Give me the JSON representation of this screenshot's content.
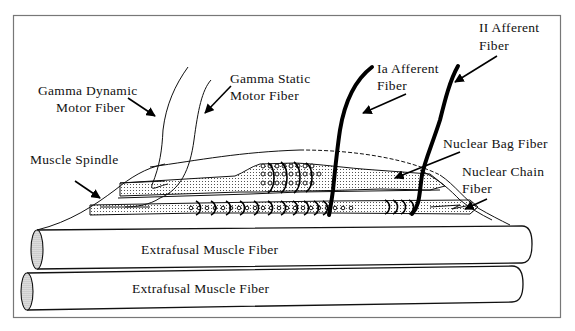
{
  "figure": {
    "labels": {
      "gamma_dynamic": [
        "Gamma Dynamic",
        "Motor Fiber"
      ],
      "gamma_static": [
        "Gamma Static",
        "Motor Fiber"
      ],
      "ia_afferent": [
        "Ia Afferent",
        "Fiber"
      ],
      "ii_afferent": [
        "II Afferent",
        "Fiber"
      ],
      "muscle_spindle": "Muscle Spindle",
      "nuclear_bag": "Nuclear Bag Fiber",
      "nuclear_chain": [
        "Nuclear Chain",
        "Fiber"
      ],
      "extrafusal_1": "Extrafusal Muscle Fiber",
      "extrafusal_2": "Extrafusal Muscle Fiber"
    },
    "colors": {
      "ink": "#111111",
      "background": "#ffffff",
      "frame": "#777777"
    }
  }
}
